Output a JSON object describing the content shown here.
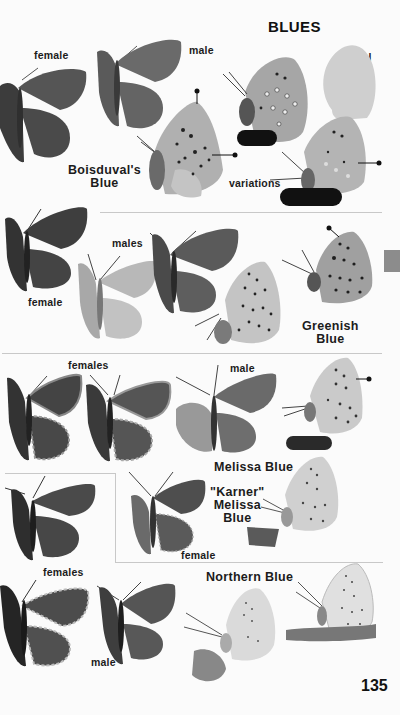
{
  "page": {
    "section_title": "BLUES",
    "page_number": "135",
    "thumb_tab_color": "#8c8c8c"
  },
  "plates": [
    {
      "species": "Boisduval's Blue",
      "species_lines": [
        "Boisduval's",
        "Blue"
      ],
      "labels": {
        "female": "female",
        "male": "male",
        "actual_size": "actual size",
        "actual_size_lines": [
          "actual",
          "size"
        ],
        "variations": "variations"
      }
    },
    {
      "species": "Greenish Blue",
      "species_lines": [
        "Greenish",
        "Blue"
      ],
      "labels": {
        "female": "female",
        "males": "males"
      }
    },
    {
      "species": "Melissa Blue",
      "labels": {
        "females": "females",
        "male": "male"
      }
    },
    {
      "species": "\"Karner\" Melissa Blue",
      "species_lines": [
        "\"Karner\"",
        "Melissa",
        "Blue"
      ],
      "labels": {
        "female": "female"
      }
    },
    {
      "species": "Northern Blue",
      "labels": {
        "females": "females",
        "male": "male"
      }
    }
  ],
  "icons": {
    "butterfly_dorsal": "butterfly-open-wings-icon",
    "butterfly_ventral": "butterfly-side-view-icon",
    "silhouette": "actual-size-silhouette-icon",
    "pointer": "field-mark-pointer-icon"
  },
  "colors": {
    "dark_wing": "#4a4a4a",
    "mid_wing": "#6e6e6e",
    "light_wing": "#bdbdbd",
    "underside": "#a9a9a9",
    "silhouette": "#cfcfcf",
    "rule": "#c8c8c8"
  }
}
